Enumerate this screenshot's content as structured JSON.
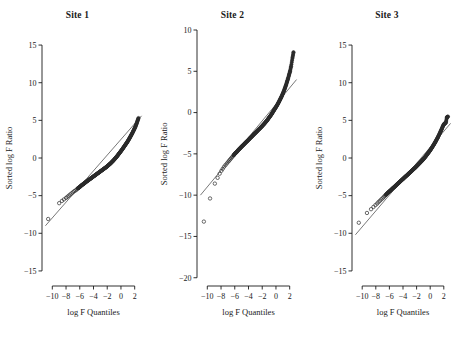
{
  "figure": {
    "background": "#ffffff",
    "axis_color": "#1a1a1a",
    "point_color": "#2b2b2b",
    "line_color": "#555555"
  },
  "panels": [
    {
      "title": "Site 1",
      "xlabel": "log F Quantiles",
      "ylabel": "Sorted log F Ratio",
      "xlim": [
        -11.5,
        3.5
      ],
      "ylim": [
        -17,
        17
      ],
      "xticks": [
        -10,
        -8,
        -6,
        -4,
        -2,
        0,
        2
      ],
      "xtick_labels": [
        "−10",
        "−8",
        "−6",
        "−4",
        "−2",
        "0",
        "2"
      ],
      "yticks": [
        -15,
        -10,
        -5,
        0,
        5,
        10,
        15
      ],
      "ytick_labels": [
        "−15",
        "−10",
        "−5",
        "0",
        "5",
        "10",
        "15"
      ],
      "ref_line": {
        "x": [
          -11.0,
          3.0
        ],
        "y": [
          -9.0,
          5.6
        ]
      },
      "points_x": [
        -10.6,
        -9.0,
        -8.6,
        -8.3,
        -8.0,
        -7.8,
        -7.6,
        -7.4,
        -7.2,
        -7.0,
        -6.8,
        -6.6,
        -6.45,
        -6.3,
        -6.15,
        -6.0,
        -5.85,
        -5.7,
        -5.55,
        -5.4,
        -5.25,
        -5.1,
        -4.95,
        -4.8,
        -4.65,
        -4.5,
        -4.35,
        -4.2,
        -4.05,
        -3.9,
        -3.75,
        -3.6,
        -3.45,
        -3.3,
        -3.15,
        -3.0,
        -2.85,
        -2.7,
        -2.55,
        -2.4,
        -2.25,
        -2.1,
        -1.95,
        -1.8,
        -1.65,
        -1.5,
        -1.35,
        -1.2,
        -1.05,
        -0.9,
        -0.75,
        -0.6,
        -0.45,
        -0.3,
        -0.15,
        0.0,
        0.15,
        0.3,
        0.45,
        0.6,
        0.75,
        0.9,
        1.05,
        1.2,
        1.35,
        1.5,
        1.65,
        1.8,
        1.95,
        2.1,
        2.25,
        2.4,
        2.55
      ],
      "points_y": [
        -8.1,
        -6.0,
        -5.7,
        -5.5,
        -5.3,
        -5.15,
        -5.0,
        -4.85,
        -4.7,
        -4.55,
        -4.4,
        -4.3,
        -4.18,
        -4.05,
        -3.95,
        -3.85,
        -3.72,
        -3.6,
        -3.5,
        -3.4,
        -3.3,
        -3.18,
        -3.08,
        -2.98,
        -2.88,
        -2.78,
        -2.68,
        -2.58,
        -2.48,
        -2.38,
        -2.28,
        -2.18,
        -2.08,
        -1.98,
        -1.88,
        -1.78,
        -1.68,
        -1.58,
        -1.48,
        -1.38,
        -1.28,
        -1.18,
        -1.06,
        -0.94,
        -0.82,
        -0.7,
        -0.56,
        -0.42,
        -0.28,
        -0.12,
        0.04,
        0.2,
        0.38,
        0.56,
        0.74,
        0.92,
        1.1,
        1.3,
        1.5,
        1.7,
        1.9,
        2.1,
        2.32,
        2.56,
        2.8,
        3.05,
        3.3,
        3.58,
        3.86,
        4.16,
        4.5,
        4.9,
        5.3
      ],
      "open_markers": 14
    },
    {
      "title": "Site 2",
      "xlabel": "log F Quantiles",
      "ylabel": "Sorted log F Ratio",
      "xlim": [
        -11.5,
        3.5
      ],
      "ylim": [
        -21,
        10
      ],
      "xticks": [
        -10,
        -8,
        -6,
        -4,
        -2,
        0,
        2
      ],
      "xtick_labels": [
        "−10",
        "−8",
        "−6",
        "−4",
        "−2",
        "0",
        "2"
      ],
      "yticks": [
        -20,
        -15,
        -10,
        -5,
        0,
        5,
        10
      ],
      "ytick_labels": [
        "−20",
        "−15",
        "−10",
        "−5",
        "0",
        "5",
        "10"
      ],
      "ref_line": {
        "x": [
          -11.0,
          3.0
        ],
        "y": [
          -10.0,
          4.0
        ]
      },
      "points_x": [
        -10.5,
        -9.6,
        -8.9,
        -8.5,
        -8.2,
        -7.95,
        -7.75,
        -7.55,
        -7.35,
        -7.15,
        -6.95,
        -6.8,
        -6.65,
        -6.5,
        -6.35,
        -6.2,
        -6.05,
        -5.9,
        -5.75,
        -5.6,
        -5.45,
        -5.3,
        -5.15,
        -5.0,
        -4.85,
        -4.7,
        -4.55,
        -4.4,
        -4.25,
        -4.1,
        -3.95,
        -3.8,
        -3.65,
        -3.5,
        -3.35,
        -3.2,
        -3.05,
        -2.9,
        -2.75,
        -2.6,
        -2.45,
        -2.3,
        -2.15,
        -2.0,
        -1.85,
        -1.7,
        -1.55,
        -1.4,
        -1.25,
        -1.1,
        -0.95,
        -0.8,
        -0.65,
        -0.5,
        -0.35,
        -0.2,
        -0.05,
        0.1,
        0.25,
        0.4,
        0.55,
        0.7,
        0.85,
        1.0,
        1.15,
        1.3,
        1.45,
        1.6,
        1.75,
        1.9,
        2.05,
        2.2,
        2.4,
        2.55
      ],
      "points_y": [
        -13.2,
        -10.4,
        -8.6,
        -7.9,
        -7.4,
        -7.05,
        -6.8,
        -6.55,
        -6.35,
        -6.15,
        -5.95,
        -5.8,
        -5.65,
        -5.5,
        -5.35,
        -5.2,
        -5.05,
        -4.9,
        -4.8,
        -4.65,
        -4.5,
        -4.38,
        -4.25,
        -4.12,
        -4.0,
        -3.88,
        -3.75,
        -3.62,
        -3.5,
        -3.38,
        -3.25,
        -3.12,
        -3.0,
        -2.88,
        -2.75,
        -2.62,
        -2.5,
        -2.38,
        -2.25,
        -2.12,
        -2.0,
        -1.88,
        -1.75,
        -1.62,
        -1.48,
        -1.35,
        -1.2,
        -1.05,
        -0.9,
        -0.72,
        -0.55,
        -0.38,
        -0.2,
        0.0,
        0.2,
        0.4,
        0.6,
        0.8,
        1.02,
        1.25,
        1.5,
        1.75,
        2.0,
        2.3,
        2.6,
        2.95,
        3.3,
        3.7,
        4.1,
        4.55,
        5.0,
        5.6,
        6.6,
        7.3
      ],
      "open_markers": 16
    },
    {
      "title": "Site 3",
      "xlabel": "log F Quantiles",
      "ylabel": "Sorted log F Ratio",
      "xlim": [
        -11.5,
        3.5
      ],
      "ylim": [
        -17,
        17
      ],
      "xticks": [
        -10,
        -8,
        -6,
        -4,
        -2,
        0,
        2
      ],
      "xtick_labels": [
        "−10",
        "−8",
        "−6",
        "−4",
        "−2",
        "0",
        "2"
      ],
      "yticks": [
        -15,
        -10,
        -5,
        0,
        5,
        10,
        15
      ],
      "ytick_labels": [
        "−15",
        "−10",
        "−5",
        "0",
        "5",
        "10",
        "15"
      ],
      "ref_line": {
        "x": [
          -11.0,
          3.0
        ],
        "y": [
          -10.2,
          4.6
        ]
      },
      "points_x": [
        -10.5,
        -9.3,
        -8.7,
        -8.35,
        -8.05,
        -7.8,
        -7.6,
        -7.4,
        -7.2,
        -7.0,
        -6.85,
        -6.7,
        -6.55,
        -6.4,
        -6.25,
        -6.1,
        -5.95,
        -5.8,
        -5.65,
        -5.5,
        -5.35,
        -5.2,
        -5.05,
        -4.9,
        -4.75,
        -4.6,
        -4.45,
        -4.3,
        -4.15,
        -4.0,
        -3.85,
        -3.7,
        -3.55,
        -3.4,
        -3.25,
        -3.1,
        -2.95,
        -2.8,
        -2.65,
        -2.5,
        -2.35,
        -2.2,
        -2.05,
        -1.9,
        -1.75,
        -1.6,
        -1.45,
        -1.3,
        -1.15,
        -1.0,
        -0.85,
        -0.7,
        -0.55,
        -0.4,
        -0.25,
        -0.1,
        0.05,
        0.2,
        0.35,
        0.5,
        0.65,
        0.8,
        0.95,
        1.1,
        1.25,
        1.4,
        1.55,
        1.7,
        1.85,
        2.0,
        2.15,
        2.3,
        2.45,
        2.6
      ],
      "points_y": [
        -8.6,
        -7.3,
        -6.8,
        -6.5,
        -6.25,
        -6.05,
        -5.85,
        -5.68,
        -5.5,
        -5.35,
        -5.2,
        -5.05,
        -4.92,
        -4.78,
        -4.65,
        -4.52,
        -4.4,
        -4.28,
        -4.15,
        -4.02,
        -3.9,
        -3.78,
        -3.65,
        -3.52,
        -3.4,
        -3.28,
        -3.15,
        -3.02,
        -2.9,
        -2.78,
        -2.65,
        -2.52,
        -2.4,
        -2.28,
        -2.15,
        -2.02,
        -1.9,
        -1.78,
        -1.65,
        -1.52,
        -1.4,
        -1.28,
        -1.14,
        -1.0,
        -0.86,
        -0.72,
        -0.58,
        -0.44,
        -0.3,
        -0.14,
        0.02,
        0.18,
        0.36,
        0.54,
        0.72,
        0.9,
        1.1,
        1.3,
        1.52,
        1.74,
        1.96,
        2.2,
        2.45,
        2.7,
        2.98,
        3.26,
        3.56,
        3.86,
        4.2,
        4.45,
        4.6,
        4.7,
        5.4,
        5.5
      ],
      "open_markers": 13
    }
  ],
  "chart_data": {
    "type": "scatter",
    "title": "",
    "panel_titles": [
      "Site 1",
      "Site 2",
      "Site 3"
    ],
    "xlabel": "log F Quantiles",
    "ylabel": "Sorted log F Ratio",
    "grid": false,
    "legend": "none",
    "series": [
      {
        "name": "Site 1",
        "xlim": [
          -11.5,
          3.5
        ],
        "ylim": [
          -17,
          17
        ],
        "x": [
          -10.6,
          -9.0,
          -8.6,
          -8.0,
          -7.4,
          -6.8,
          -6.3,
          -5.7,
          -5.1,
          -4.5,
          -3.9,
          -3.3,
          -2.7,
          -2.1,
          -1.5,
          -0.9,
          -0.3,
          0.3,
          0.9,
          1.5,
          2.1,
          2.55
        ],
        "y": [
          -8.1,
          -6.0,
          -5.7,
          -5.3,
          -4.85,
          -4.4,
          -4.05,
          -3.6,
          -3.18,
          -2.78,
          -2.38,
          -1.98,
          -1.58,
          -1.18,
          -0.7,
          -0.12,
          0.56,
          1.3,
          2.1,
          3.05,
          4.16,
          5.3
        ]
      },
      {
        "name": "Site 2",
        "xlim": [
          -11.5,
          3.5
        ],
        "ylim": [
          -21,
          10
        ],
        "x": [
          -10.5,
          -9.6,
          -8.9,
          -8.2,
          -7.55,
          -6.95,
          -6.35,
          -5.75,
          -5.15,
          -4.55,
          -3.95,
          -3.35,
          -2.75,
          -2.15,
          -1.55,
          -0.95,
          -0.35,
          0.25,
          0.85,
          1.45,
          2.05,
          2.55
        ],
        "y": [
          -13.2,
          -10.4,
          -8.6,
          -7.4,
          -6.55,
          -5.95,
          -5.35,
          -4.8,
          -4.25,
          -3.75,
          -3.25,
          -2.75,
          -2.25,
          -1.75,
          -1.2,
          -0.55,
          0.2,
          1.02,
          2.0,
          3.3,
          5.0,
          7.3
        ]
      },
      {
        "name": "Site 3",
        "xlim": [
          -11.5,
          3.5
        ],
        "ylim": [
          -17,
          17
        ],
        "x": [
          -10.5,
          -9.3,
          -8.7,
          -8.05,
          -7.4,
          -6.85,
          -6.25,
          -5.65,
          -5.05,
          -4.45,
          -3.85,
          -3.25,
          -2.65,
          -2.05,
          -1.45,
          -0.85,
          -0.25,
          0.35,
          0.95,
          1.55,
          2.15,
          2.6
        ],
        "y": [
          -8.6,
          -7.3,
          -6.8,
          -6.25,
          -5.68,
          -5.2,
          -4.65,
          -4.15,
          -3.65,
          -3.15,
          -2.65,
          -2.15,
          -1.65,
          -1.14,
          -0.58,
          0.02,
          0.72,
          1.52,
          2.45,
          3.56,
          4.6,
          5.5
        ]
      }
    ]
  }
}
